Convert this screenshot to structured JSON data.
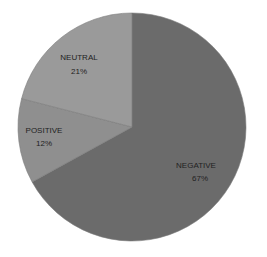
{
  "chart_data": {
    "type": "pie",
    "title": "",
    "categories": [
      "NEGATIVE",
      "POSITIVE",
      "NEUTRAL"
    ],
    "values": [
      67,
      12,
      21
    ],
    "labels": [
      {
        "name": "NEGATIVE",
        "pct": "67%"
      },
      {
        "name": "POSITIVE",
        "pct": "12%"
      },
      {
        "name": "NEUTRAL",
        "pct": "21%"
      }
    ],
    "colors": [
      "#6b6b6b",
      "#8f8f8f",
      "#9a9a9a"
    ],
    "start_angle_deg": 0,
    "direction": "clockwise",
    "legend": "none",
    "data_labels": "inside"
  }
}
